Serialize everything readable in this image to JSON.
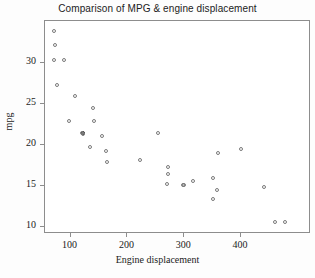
{
  "chart_data": {
    "type": "scatter",
    "title": "Comparison of MPG & engine displacement",
    "xlabel": "Engine displacement",
    "ylabel": "mpg",
    "xlim": [
      55,
      523
    ],
    "ylim": [
      9.2,
      35.1
    ],
    "xticks": [
      100,
      200,
      300,
      400
    ],
    "xticklabels": [
      "100",
      "200",
      "300",
      "400"
    ],
    "yticks": [
      10,
      15,
      20,
      25,
      30
    ],
    "yticklabels": [
      "10",
      "15",
      "20",
      "25",
      "30"
    ],
    "grid": false,
    "legend": null,
    "marker": "open-circle",
    "marker_color": "#7a7a7a",
    "frame_color": "#8d8d8d",
    "background": "#ffffff",
    "series": [
      {
        "name": "vehicles",
        "points": [
          {
            "x": 70,
            "y": 33.9
          },
          {
            "x": 72,
            "y": 32.2
          },
          {
            "x": 71,
            "y": 30.4
          },
          {
            "x": 89,
            "y": 30.4
          },
          {
            "x": 76,
            "y": 27.3
          },
          {
            "x": 98,
            "y": 22.9
          },
          {
            "x": 108,
            "y": 26.0
          },
          {
            "x": 121,
            "y": 21.5
          },
          {
            "x": 121,
            "y": 21.4
          },
          {
            "x": 120,
            "y": 21.5
          },
          {
            "x": 140,
            "y": 24.5
          },
          {
            "x": 141,
            "y": 22.9
          },
          {
            "x": 134,
            "y": 19.8
          },
          {
            "x": 156,
            "y": 21.1
          },
          {
            "x": 162,
            "y": 19.3
          },
          {
            "x": 164,
            "y": 17.9
          },
          {
            "x": 222,
            "y": 18.2
          },
          {
            "x": 254,
            "y": 21.5
          },
          {
            "x": 271,
            "y": 17.4
          },
          {
            "x": 271,
            "y": 16.5
          },
          {
            "x": 269,
            "y": 15.3
          },
          {
            "x": 297,
            "y": 15.2
          },
          {
            "x": 300,
            "y": 15.1
          },
          {
            "x": 315,
            "y": 15.6
          },
          {
            "x": 350,
            "y": 16.0
          },
          {
            "x": 351,
            "y": 13.5
          },
          {
            "x": 358,
            "y": 14.6
          },
          {
            "x": 360,
            "y": 19.0
          },
          {
            "x": 400,
            "y": 19.5
          },
          {
            "x": 440,
            "y": 14.9
          },
          {
            "x": 460,
            "y": 10.6
          },
          {
            "x": 478,
            "y": 10.6
          }
        ]
      }
    ],
    "overlapping_points": [
      {
        "x": 121,
        "y": 21.5
      },
      {
        "x": 298,
        "y": 15.2
      }
    ]
  }
}
